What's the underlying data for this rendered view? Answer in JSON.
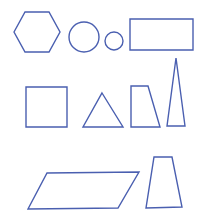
{
  "canvas": {
    "width": 209,
    "height": 216,
    "background": "#ffffff"
  },
  "style": {
    "stroke": "#4a5fb0",
    "stroke_width": 1.4
  },
  "rows": [
    {
      "name": "row-1",
      "shapes": [
        {
          "id": "hexagon",
          "type": "polygon",
          "points": "14,32 25,12 49,12 60,32 49,52 25,52"
        },
        {
          "id": "large-circle",
          "type": "circle",
          "cx": 84,
          "cy": 37,
          "r": 15
        },
        {
          "id": "small-circle",
          "type": "circle",
          "cx": 114,
          "cy": 41,
          "r": 9
        },
        {
          "id": "rectangle",
          "type": "polygon",
          "points": "130,19 193,19 193,50 130,50"
        }
      ]
    },
    {
      "name": "row-2",
      "shapes": [
        {
          "id": "square",
          "type": "polygon",
          "points": "26,87 67,87 67,127 26,127"
        },
        {
          "id": "equilateral-triangle",
          "type": "polygon",
          "points": "102,93 123,127 83,127"
        },
        {
          "id": "right-trapezoid",
          "type": "polygon",
          "points": "131,86 148,86 160,127 131,127"
        },
        {
          "id": "tall-isosceles-triangle",
          "type": "polygon",
          "points": "176,58 185,126 167,126"
        }
      ]
    },
    {
      "name": "row-3",
      "shapes": [
        {
          "id": "parallelogram",
          "type": "polygon",
          "points": "47,173 139,172 118,208 28,209"
        },
        {
          "id": "isosceles-trapezoid",
          "type": "polygon",
          "points": "154,157 172,157 182,207 146,208"
        }
      ]
    }
  ]
}
